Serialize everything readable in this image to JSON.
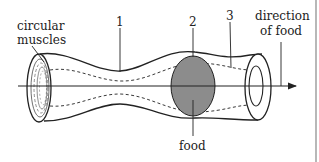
{
  "diagram": {
    "labels": {
      "circular_muscles_line1": "circular",
      "circular_muscles_line2": "muscles",
      "num1": "1",
      "num2": "2",
      "num3": "3",
      "direction_line1": "direction",
      "direction_line2": "of food",
      "food": "food"
    },
    "colors": {
      "stroke": "#222222",
      "food_fill": "#8c8c8c",
      "background": "#ffffff",
      "border": "#888888"
    }
  }
}
